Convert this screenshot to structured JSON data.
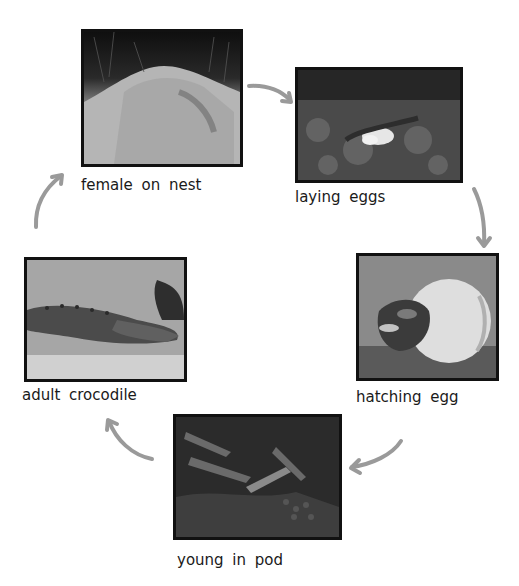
{
  "diagram": {
    "type": "life-cycle",
    "subject": "crocodile",
    "arrow_color": "#9a9a9a",
    "stages": [
      {
        "id": "female-on-nest",
        "label": "female on nest"
      },
      {
        "id": "laying-eggs",
        "label": "laying eggs"
      },
      {
        "id": "hatching-egg",
        "label": "hatching egg"
      },
      {
        "id": "young-in-pod",
        "label": "young in pod"
      },
      {
        "id": "adult-crocodile",
        "label": "adult crocodile"
      }
    ],
    "flow": [
      "female on nest -> laying eggs",
      "laying eggs -> hatching egg",
      "hatching egg -> young in pod",
      "young in pod -> adult crocodile",
      "adult crocodile -> female on nest"
    ]
  }
}
